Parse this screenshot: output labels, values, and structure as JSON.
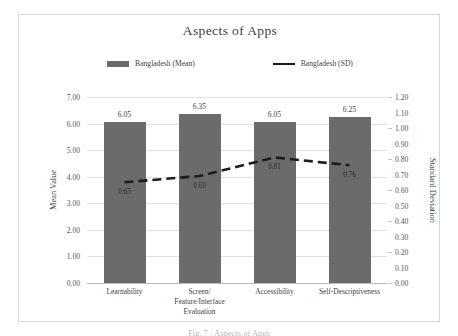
{
  "chart_data": {
    "type": "bar",
    "title": "Aspects of Apps",
    "categories": [
      "Learnability",
      "Screen/ Feature/Interface Evaluation",
      "Accessibility",
      "Self-Descriptiveness"
    ],
    "category_lines": [
      [
        "Learnability"
      ],
      [
        "Screen/",
        "Feature/Interface",
        "Evaluation"
      ],
      [
        "Accessibility"
      ],
      [
        "Self-Descriptiveness"
      ]
    ],
    "series": [
      {
        "name": "Bangladesh (Mean)",
        "type": "bar",
        "axis": "left",
        "values": [
          6.05,
          6.35,
          6.05,
          6.25
        ],
        "labels": [
          "6.05",
          "6.35",
          "6.05",
          "6.25"
        ],
        "color": "#6b6b6b"
      },
      {
        "name": "Bangladesh (SD)",
        "type": "line",
        "axis": "right",
        "values": [
          0.65,
          0.69,
          0.81,
          0.76
        ],
        "labels": [
          "0.65",
          "0.69",
          "0.81",
          "0.76"
        ],
        "color": "#1d1d1d",
        "dashed": true
      }
    ],
    "xlabel": "",
    "ylabel": "Mean Value",
    "ylabel_right": "Standard Deviation",
    "ylim": [
      0,
      7
    ],
    "ylim_right": [
      0,
      1.2
    ],
    "yticks": [
      "0.00",
      "1.00",
      "2.00",
      "3.00",
      "4.00",
      "5.00",
      "6.00",
      "7.00"
    ],
    "ytick_values": [
      0,
      1,
      2,
      3,
      4,
      5,
      6,
      7
    ],
    "yticks_right": [
      "0.00",
      "0.10",
      "0.20",
      "0.30",
      "0.40",
      "0.50",
      "0.60",
      "0.70",
      "0.80",
      "0.90",
      "1.00",
      "1.10",
      "1.20"
    ],
    "ytick_values_right": [
      0,
      0.1,
      0.2,
      0.3,
      0.4,
      0.5,
      0.6,
      0.7,
      0.8,
      0.9,
      1.0,
      1.1,
      1.2
    ],
    "grid": true,
    "legend_position": "top"
  },
  "legend": {
    "entries": [
      {
        "label": "Bangladesh (Mean)",
        "marker": "bar-swatch",
        "color": "#6b6b6b"
      },
      {
        "label": "Bangladesh (SD)",
        "marker": "line-swatch",
        "color": "#1d1d1d"
      }
    ]
  },
  "caption": {
    "text": "Fig. 7 : Aspects of Apps"
  }
}
